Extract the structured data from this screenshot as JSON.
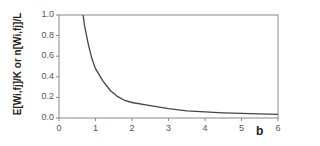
{
  "chart_data": {
    "type": "line",
    "title": "",
    "xlabel": "b",
    "ylabel": "E[Wi,fj]/K or n[Wi,fj]/L",
    "xlim": [
      0,
      6
    ],
    "ylim": [
      0,
      1.0
    ],
    "xticks": [
      "0",
      "1",
      "2",
      "3",
      "4",
      "5",
      "6"
    ],
    "yticks": [
      "0.0",
      "0.2",
      "0.4",
      "0.6",
      "0.8",
      "1.0"
    ],
    "grid": false,
    "legend": null,
    "series": [
      {
        "name": "curve",
        "x": [
          0.66,
          0.7,
          0.8,
          0.9,
          1.0,
          1.2,
          1.4,
          1.6,
          1.8,
          2.0,
          2.5,
          3.0,
          3.5,
          4.0,
          4.5,
          5.0,
          5.5,
          6.0
        ],
        "values": [
          1.0,
          0.9,
          0.72,
          0.58,
          0.48,
          0.36,
          0.27,
          0.21,
          0.17,
          0.15,
          0.12,
          0.09,
          0.07,
          0.06,
          0.05,
          0.045,
          0.04,
          0.035
        ],
        "color": "#444444"
      }
    ]
  },
  "colors": {
    "axis": "#888888",
    "line": "#444444",
    "text": "#555555"
  }
}
